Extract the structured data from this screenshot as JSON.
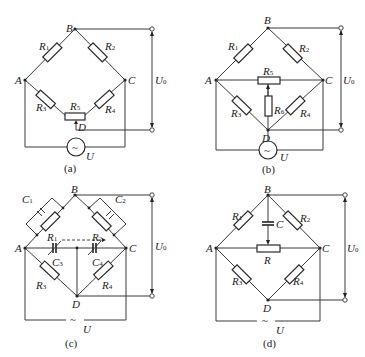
{
  "figure": {
    "panels": [
      {
        "id": "a",
        "caption": "(a)",
        "nodes": [
          "A",
          "B",
          "C",
          "D"
        ],
        "components": {
          "R1": "R1",
          "R2": "R2",
          "R3": "R3",
          "R4": "R4",
          "R5": "R5"
        },
        "output_label": "U0",
        "source_label": "U",
        "source_symbol": "~"
      },
      {
        "id": "b",
        "caption": "(b)",
        "nodes": [
          "A",
          "B",
          "C",
          "D"
        ],
        "components": {
          "R1": "R1",
          "R2": "R2",
          "R3": "R3",
          "R4": "R4",
          "R5": "R5",
          "R6": "R6"
        },
        "output_label": "U0",
        "source_label": "U",
        "source_symbol": "~"
      },
      {
        "id": "c",
        "caption": "(c)",
        "nodes": [
          "A",
          "B",
          "C",
          "D"
        ],
        "components": {
          "C1": "C1",
          "C2": "C2",
          "R1": "R1",
          "R2": "R2",
          "C3": "C3",
          "C4": "C4",
          "R3": "R3",
          "R4": "R4"
        },
        "output_label": "U0",
        "source_label": "U",
        "source_symbol": "~"
      },
      {
        "id": "d",
        "caption": "(d)",
        "nodes": [
          "A",
          "B",
          "C",
          "D"
        ],
        "components": {
          "R1": "R1",
          "R2": "R2",
          "C": "C",
          "R": "R",
          "R3": "R3",
          "R4": "R4"
        },
        "output_label": "U0",
        "source_label": "U",
        "source_symbol": "~"
      }
    ]
  },
  "labels": {
    "A": "A",
    "B": "B",
    "C": "C",
    "D": "D",
    "R": "R",
    "Cap": "C",
    "U": "U",
    "U0_main": "U",
    "sub0": "0",
    "sub1": "1",
    "sub2": "2",
    "sub3": "3",
    "sub4": "4",
    "sub5": "5",
    "sub6": "6",
    "tilde": "~",
    "dotmark": "·",
    "cap_a": "(a)",
    "cap_b": "(b)",
    "cap_c": "(c)",
    "cap_d": "(d)"
  }
}
